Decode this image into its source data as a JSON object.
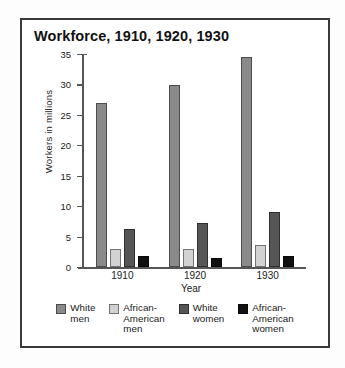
{
  "chart_data": {
    "type": "bar",
    "title": "Workforce, 1910, 1920, 1930",
    "xlabel": "Year",
    "ylabel": "Workers in millions",
    "categories": [
      "1910",
      "1920",
      "1930"
    ],
    "ylim": [
      0,
      35
    ],
    "yticks": [
      0,
      5,
      10,
      15,
      20,
      25,
      30,
      35
    ],
    "grid": false,
    "legend_position": "bottom",
    "series": [
      {
        "name": "White men",
        "color": "#8a8a8a",
        "values": [
          27,
          29.9,
          34.5
        ]
      },
      {
        "name": "African-American men",
        "color": "#d2d2d2",
        "values": [
          3,
          3,
          3.6
        ]
      },
      {
        "name": "White women",
        "color": "#565656",
        "values": [
          6.3,
          7.2,
          9
        ]
      },
      {
        "name": "African-American women",
        "color": "#111111",
        "values": [
          1.8,
          1.5,
          1.8
        ]
      }
    ]
  },
  "legend": [
    {
      "label_line1": "White",
      "label_line2": "men"
    },
    {
      "label_line1": "African-",
      "label_line2": "American",
      "label_line3": "men"
    },
    {
      "label_line1": "White",
      "label_line2": "women"
    },
    {
      "label_line1": "African-",
      "label_line2": "American",
      "label_line3": "women"
    }
  ]
}
